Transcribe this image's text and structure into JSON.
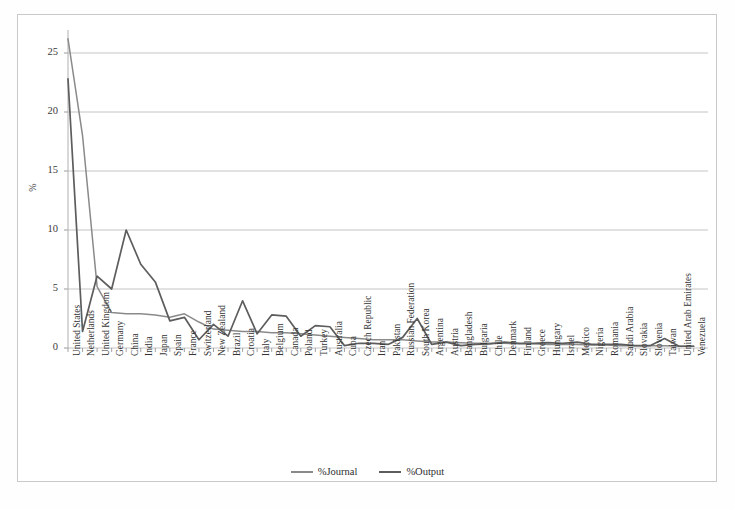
{
  "chart_data": {
    "type": "line",
    "title": "",
    "xlabel": "",
    "ylabel": "%",
    "ylim": [
      0,
      26.5
    ],
    "yticks": [
      0,
      5,
      10,
      15,
      20,
      25
    ],
    "grid": true,
    "legend_position": "bottom",
    "categories": [
      "United States",
      "Netherlands",
      "United Kingdom",
      "Germany",
      "China",
      "India",
      "Japan",
      "Spain",
      "France",
      "Switzerland",
      "New Zealand",
      "Brazil",
      "Croatia",
      "Italy",
      "Belgium",
      "Canada",
      "Poland",
      "Turkey",
      "Australia",
      "Cuba",
      "Czech Republic",
      "Iran",
      "Pakistan",
      "Russian Federation",
      "South Korea",
      "Argentina",
      "Austria",
      "Bangladesh",
      "Bulgaria",
      "Chile",
      "Denmark",
      "Finland",
      "Greece",
      "Hungary",
      "Israel",
      "Mexico",
      "Nigeria",
      "Romania",
      "Saudi Arabia",
      "Slovakia",
      "Slovenia",
      "Taiwan",
      "United Arab Emirates",
      "Venezuela"
    ],
    "series": [
      {
        "name": "%Journal",
        "color": "#8a8a8a",
        "values": [
          26.2,
          18.0,
          5.2,
          3.0,
          2.9,
          2.9,
          2.8,
          2.6,
          2.9,
          2.2,
          1.6,
          1.5,
          1.4,
          1.4,
          1.3,
          1.3,
          1.2,
          1.1,
          1.0,
          0.9,
          0.8,
          0.7,
          0.7,
          0.7,
          0.6,
          0.5,
          0.5,
          0.45,
          0.4,
          0.4,
          0.4,
          0.35,
          0.35,
          0.3,
          0.3,
          0.3,
          0.25,
          0.25,
          0.2,
          0.2,
          0.2,
          0.2,
          0.15,
          0.15
        ]
      },
      {
        "name": "%Output",
        "color": "#5d5d5d",
        "values": [
          22.8,
          1.4,
          6.1,
          5.0,
          10.0,
          7.1,
          5.6,
          2.3,
          2.6,
          0.7,
          2.0,
          1.0,
          4.0,
          1.2,
          2.8,
          2.7,
          1.0,
          1.9,
          1.8,
          0.2,
          0.4,
          0.4,
          0.3,
          0.9,
          2.5,
          0.3,
          0.5,
          0.2,
          0.3,
          0.35,
          0.5,
          0.4,
          0.4,
          0.45,
          0.4,
          0.5,
          0.3,
          0.3,
          0.3,
          0.2,
          0.2,
          0.8,
          0.15,
          0.15
        ]
      }
    ]
  },
  "axes": {
    "y_title": "%",
    "y_tick_labels": [
      "0",
      "5",
      "10",
      "15",
      "20",
      "25"
    ]
  },
  "legend": {
    "entries": [
      {
        "label": "%Journal",
        "color": "#8a8a8a"
      },
      {
        "label": "%Output",
        "color": "#5d5d5d"
      }
    ]
  }
}
